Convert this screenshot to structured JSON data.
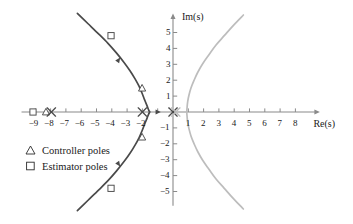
{
  "figure": {
    "kind": "root-locus-s-plane",
    "background": "#ffffff"
  },
  "axes": {
    "x_name": "Re(s)",
    "y_name": "Im(s)",
    "origin_px": {
      "x": 173,
      "y": 112
    },
    "unit_px": {
      "x": 15.3,
      "y": 15.9
    },
    "x_ticks": [
      -9,
      -8,
      -7,
      -6,
      -5,
      -4,
      -3,
      -2,
      -1,
      1,
      2,
      3,
      4,
      5,
      6,
      7,
      8
    ],
    "x_tick_labels": [
      "−9",
      "−8",
      "−7",
      "−6",
      "−5",
      "−4",
      "−3",
      "−2",
      "1",
      "2",
      "3",
      "4",
      "5",
      "6",
      "7",
      "8"
    ],
    "x_labeled_values": [
      -9,
      -8,
      -7,
      -6,
      -5,
      -4,
      -3,
      -2,
      1,
      2,
      3,
      4,
      5,
      6,
      7,
      8
    ],
    "y_ticks": [
      -5,
      -4,
      -3,
      -2,
      -1,
      1,
      2,
      3,
      4,
      5
    ],
    "y_tick_labels": [
      "−5",
      "−4",
      "−3",
      "−2",
      "−1",
      "1",
      "2",
      "3",
      "4",
      "5"
    ],
    "x_range": [
      -9.9,
      9.6
    ],
    "y_range": [
      -5.9,
      6.2
    ],
    "grid": "off",
    "axis_color": "#8a8a8a",
    "tick_color": "#8a8a8a"
  },
  "legend": {
    "position": "lower-left",
    "items": [
      {
        "symbol": "triangle",
        "label": "Controller poles"
      },
      {
        "symbol": "square",
        "label": "Estimator poles"
      }
    ]
  },
  "chart_data": {
    "type": "scatter",
    "title": "",
    "xlabel": "Re(s)",
    "ylabel": "Im(s)",
    "xlim": [
      -9.9,
      9.6
    ],
    "ylim": [
      -5.9,
      6.2
    ],
    "grid": false,
    "legend_position": "lower-left",
    "series": [
      {
        "name": "Controller locus branch (left, dark)",
        "type": "line",
        "color": "#4a4a4a",
        "points": [
          [
            -6.25,
            6.2
          ],
          [
            -5.55,
            5.55
          ],
          [
            -4.85,
            4.9
          ],
          [
            -4.25,
            4.32
          ],
          [
            -3.7,
            3.72
          ],
          [
            -3.2,
            3.12
          ],
          [
            -2.8,
            2.58
          ],
          [
            -2.48,
            2.08
          ],
          [
            -2.22,
            1.62
          ],
          [
            -2.02,
            1.18
          ],
          [
            -1.86,
            0.78
          ],
          [
            -1.7,
            0.4
          ],
          [
            -1.58,
            0.1
          ],
          [
            -1.52,
            0.0
          ],
          [
            -1.58,
            -0.1
          ],
          [
            -1.7,
            -0.4
          ],
          [
            -1.86,
            -0.78
          ],
          [
            -2.02,
            -1.18
          ],
          [
            -2.22,
            -1.62
          ],
          [
            -2.48,
            -2.08
          ],
          [
            -2.8,
            -2.58
          ],
          [
            -3.2,
            -3.12
          ],
          [
            -3.7,
            -3.72
          ],
          [
            -4.25,
            -4.32
          ],
          [
            -4.85,
            -4.9
          ],
          [
            -5.55,
            -5.55
          ],
          [
            -6.25,
            -6.2
          ]
        ]
      },
      {
        "name": "Mirror locus branch (right, light)",
        "type": "line",
        "color": "#bdbdbd",
        "points": [
          [
            4.6,
            6.1
          ],
          [
            3.95,
            5.45
          ],
          [
            3.35,
            4.8
          ],
          [
            2.8,
            4.2
          ],
          [
            2.35,
            3.6
          ],
          [
            1.95,
            3.05
          ],
          [
            1.62,
            2.5
          ],
          [
            1.38,
            2.0
          ],
          [
            1.18,
            1.52
          ],
          [
            1.05,
            1.08
          ],
          [
            0.96,
            0.66
          ],
          [
            0.92,
            0.28
          ],
          [
            0.9,
            0.0
          ],
          [
            0.92,
            -0.28
          ],
          [
            0.96,
            -0.66
          ],
          [
            1.05,
            -1.08
          ],
          [
            1.18,
            -1.52
          ],
          [
            1.38,
            -2.0
          ],
          [
            1.62,
            -2.5
          ],
          [
            1.95,
            -3.05
          ],
          [
            2.35,
            -3.6
          ],
          [
            2.8,
            -4.2
          ],
          [
            3.35,
            -4.8
          ],
          [
            3.95,
            -5.45
          ],
          [
            4.6,
            -6.1
          ]
        ]
      },
      {
        "name": "Estimator poles",
        "type": "scatter",
        "marker": "square",
        "color": "#4a4a4a",
        "points": [
          [
            -9.15,
            0.0
          ],
          [
            -4.05,
            4.8
          ],
          [
            -4.05,
            -4.8
          ]
        ]
      },
      {
        "name": "Controller poles",
        "type": "scatter",
        "marker": "triangle",
        "color": "#4a4a4a",
        "points": [
          [
            -8.3,
            0.0
          ],
          [
            -2.02,
            1.5
          ],
          [
            -2.02,
            -1.58
          ]
        ]
      },
      {
        "name": "Open-loop poles (dark x)",
        "type": "scatter",
        "marker": "x",
        "color": "#4a4a4a",
        "points": [
          [
            -7.95,
            0.0
          ],
          [
            -2.0,
            0.0
          ],
          [
            0.0,
            0.0
          ]
        ]
      },
      {
        "name": "Mirror open-loop poles (light x)",
        "type": "scatter",
        "marker": "x",
        "color": "#bdbdbd",
        "points": [
          [
            0.18,
            0.0
          ]
        ]
      },
      {
        "name": "Locus direction arrows",
        "type": "arrow-markers",
        "color": "#4a4a4a",
        "points": [
          [
            -3.45,
            3.42
          ],
          [
            -3.45,
            -3.42
          ],
          [
            -0.8,
            0.0
          ]
        ]
      }
    ]
  }
}
